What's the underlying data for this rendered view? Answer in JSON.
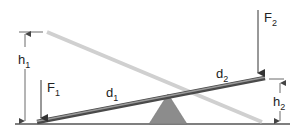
{
  "diagram": {
    "type": "lever-seesaw",
    "colors": {
      "ground": "#555555",
      "beam_current": "#7a7a7a",
      "beam_current_edge": "#4a4a4a",
      "beam_previous": "#cfcfcf",
      "fulcrum": "#8c8c8c",
      "arrow": "#333333",
      "dimension": "#444444",
      "text": "#222222"
    },
    "labels": {
      "h1": {
        "main": "h",
        "sub": "1"
      },
      "h2": {
        "main": "h",
        "sub": "2"
      },
      "F1": {
        "main": "F",
        "sub": "1"
      },
      "F2": {
        "main": "F",
        "sub": "2"
      },
      "d1": {
        "main": "d",
        "sub": "1"
      },
      "d2": {
        "main": "d",
        "sub": "2"
      }
    }
  }
}
